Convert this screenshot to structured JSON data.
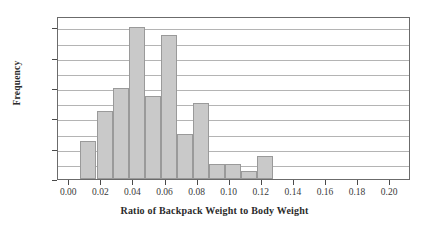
{
  "chart_data": {
    "type": "bar",
    "title": "",
    "xlabel": "Ratio of Backpack Weight to Body Weight",
    "ylabel": "Frequency",
    "bin_width": 0.01,
    "bin_starts": [
      0.007,
      0.017,
      0.027,
      0.037,
      0.047,
      0.057,
      0.067,
      0.077,
      0.087,
      0.097,
      0.107,
      0.117
    ],
    "categories": [
      "0.007-0.017",
      "0.017-0.027",
      "0.027-0.037",
      "0.037-0.047",
      "0.047-0.057",
      "0.057-0.067",
      "0.067-0.077",
      "0.077-0.087",
      "0.087-0.097",
      "0.097-0.107",
      "0.107-0.117",
      "0.117-0.127"
    ],
    "values": [
      5,
      9,
      12,
      20,
      11,
      19,
      6,
      10,
      2,
      2,
      1,
      3
    ],
    "xlim": [
      -0.007,
      0.213
    ],
    "ylim": [
      0,
      21.5
    ],
    "xticks": [
      0.0,
      0.02,
      0.04,
      0.06,
      0.08,
      0.1,
      0.12,
      0.14,
      0.16,
      0.18,
      0.2
    ],
    "xticklabels": [
      "0.00",
      "0.02",
      "0.04",
      "0.06",
      "0.08",
      "0.10",
      "0.12",
      "0.14",
      "0.16",
      "0.18",
      "0.20"
    ],
    "yticks": [
      0,
      4,
      8,
      12,
      16,
      20
    ],
    "yticklabels": [
      "0",
      "4",
      "8",
      "12",
      "16",
      "20"
    ],
    "gridlines_y": [
      2,
      4,
      6,
      8,
      10,
      12,
      14,
      16,
      18,
      20
    ],
    "grid": true,
    "legend": "none",
    "bar_fill_color": "#c9c9c9",
    "bar_edge_color": "#9a9a9a",
    "grid_color": "#b4b4b4",
    "frame_color": "#6b6b6b"
  }
}
